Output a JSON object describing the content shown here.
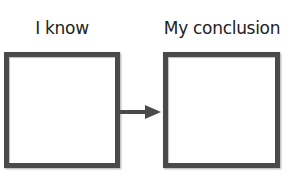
{
  "diagram": {
    "left": {
      "label": "I know"
    },
    "right": {
      "label": "My conclusion"
    },
    "connector": {
      "direction": "left-to-right",
      "color": "#4a4a4a"
    }
  }
}
